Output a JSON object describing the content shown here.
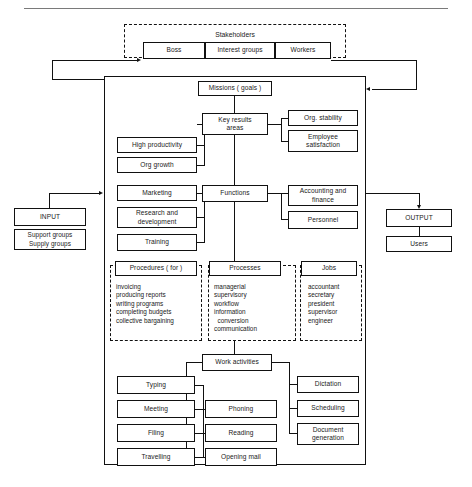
{
  "diagram": {
    "stakeholders": {
      "label": "Stakeholders",
      "members": [
        {
          "label": "Boss"
        },
        {
          "label": "Interest groups"
        },
        {
          "label": "Workers"
        }
      ]
    },
    "input": {
      "title": "INPUT",
      "detail_lines": [
        "Support groups",
        "Supply groups"
      ],
      "detail_text": "Support groups\nSupply groups"
    },
    "output": {
      "title": "OUTPUT",
      "detail": "Users"
    },
    "missions": {
      "label": "Missions ( goals )"
    },
    "key_results": {
      "label": "Key results\nareas",
      "left": [
        {
          "label": "High productivity"
        },
        {
          "label": "Org growth"
        }
      ],
      "right": [
        {
          "label": "Org. stability"
        },
        {
          "label": "Employee\nsatisfaction"
        }
      ]
    },
    "functions": {
      "label": "Functions",
      "left": [
        {
          "label": "Marketing"
        },
        {
          "label": "Research and\ndevelopment"
        },
        {
          "label": "Training"
        }
      ],
      "right": [
        {
          "label": "Accounting and\nfinance"
        },
        {
          "label": "Personnel"
        }
      ]
    },
    "procedures": {
      "label": "Procedures ( for )",
      "items": [
        "invoicing",
        "producing reports",
        "writing programs",
        "completing budgets",
        "collective bargaining"
      ],
      "items_text": "invoicing\nproducing reports\nwriting programs\ncompleting budgets\ncollective bargaining"
    },
    "processes": {
      "label": "Processes",
      "items": [
        "managerial",
        "supervisory",
        "workflow",
        "information",
        "   conversion",
        "communication"
      ],
      "items_text": "managerial\nsupervisory\nworkflow\ninformation\n  conversion\ncommunication"
    },
    "jobs": {
      "label": "Jobs",
      "items": [
        "accountant",
        "secretary",
        "president",
        "supervisor",
        "engineer"
      ],
      "items_text": "accountant\nsecretary\npresident\nsupervisor\nengineer"
    },
    "work_activities": {
      "label": "Work activities",
      "left": [
        {
          "label": "Typing"
        },
        {
          "label": "Meeting"
        },
        {
          "label": "Filing"
        },
        {
          "label": "Travelling"
        }
      ],
      "middle": [
        {
          "label": "Phoning"
        },
        {
          "label": "Reading"
        },
        {
          "label": "Opening mail"
        }
      ],
      "right": [
        {
          "label": "Dictation"
        },
        {
          "label": "Scheduling"
        },
        {
          "label": "Document\ngeneration"
        }
      ]
    },
    "colors": {
      "line": "#111111",
      "background": "#ffffff",
      "rule": "#7a7a7a"
    }
  }
}
